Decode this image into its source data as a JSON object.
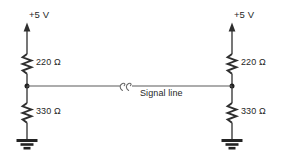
{
  "diagram": {
    "type": "schematic",
    "background_color": "#ffffff",
    "line_color": "#2e2e2e",
    "signal_line_color": "#5a5a5a"
  },
  "labels": {
    "supply_left": "+5 V",
    "supply_right": "+5 V",
    "r_pullup_left": "220 Ω",
    "r_pulldown_left": "330 Ω",
    "r_pullup_right": "220 Ω",
    "r_pulldown_right": "330 Ω",
    "signal_line": "Signal line"
  },
  "nodes": {
    "left": {
      "name": "left-termination-network",
      "supply_voltage": "+5 V",
      "pullup_resistor": "220 Ω",
      "pulldown_resistor": "330 Ω",
      "ground": "ground"
    },
    "right": {
      "name": "right-termination-network",
      "supply_voltage": "+5 V",
      "pullup_resistor": "220 Ω",
      "pulldown_resistor": "330 Ω",
      "ground": "ground"
    }
  },
  "symbols": {
    "supply_arrow": "up-arrow",
    "resistor": "zigzag-resistor",
    "ground": "earth-ground",
    "junction": "junction-dot",
    "wire_break": "break-squiggle"
  }
}
